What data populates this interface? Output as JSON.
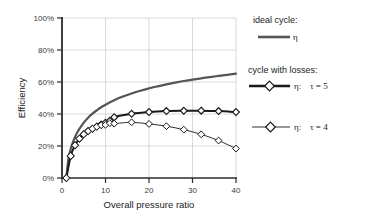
{
  "chart_data": {
    "type": "line",
    "title": "",
    "xlabel": "Overall pressure ratio",
    "ylabel": "Efficiency",
    "xlim": [
      0,
      40
    ],
    "ylim": [
      0,
      100
    ],
    "grid": true,
    "legend_position": "right",
    "xticks": [
      "0",
      "10",
      "20",
      "30",
      "40"
    ],
    "xtick_values": [
      0,
      10,
      20,
      30,
      40
    ],
    "yticks": [
      "0%",
      "20%",
      "40%",
      "60%",
      "80%",
      "100%"
    ],
    "ytick_values": [
      0,
      20,
      40,
      60,
      80,
      100
    ],
    "series": [
      {
        "name": "ideal cycle",
        "legend_symbol": "η",
        "style": "thick-line-no-marker",
        "color": "#555555",
        "x": [
          1,
          1.5,
          2,
          2.5,
          3,
          3.5,
          4,
          5,
          6,
          7,
          8,
          9,
          10,
          12,
          14,
          16,
          18,
          20,
          22,
          24,
          26,
          28,
          30,
          32,
          34,
          36,
          38,
          40
        ],
        "values": [
          0,
          12.5,
          18.1,
          22.2,
          25.6,
          28.4,
          30.7,
          34.6,
          37.7,
          40.2,
          42.3,
          44.2,
          45.8,
          48.6,
          50.9,
          52.8,
          54.5,
          56.0,
          57.3,
          58.5,
          59.6,
          60.6,
          61.5,
          62.3,
          63.1,
          63.8,
          64.5,
          65.2
        ]
      },
      {
        "name": "cycle with losses, tau = 5",
        "legend_symbol": "η",
        "legend_param": "τ = 5",
        "style": "thick-line-diamond-marker",
        "color": "#1a1a1a",
        "x": [
          1,
          2,
          3,
          4,
          5,
          6,
          7,
          8,
          9,
          10,
          11,
          12,
          16,
          20,
          24,
          28,
          32,
          36,
          40
        ],
        "values": [
          0,
          13.8,
          20.5,
          24.6,
          27.3,
          29.3,
          30.8,
          32.2,
          33.4,
          34.5,
          35.8,
          38.0,
          40.1,
          41.2,
          41.8,
          42.0,
          42.1,
          41.8,
          41.2
        ]
      },
      {
        "name": "cycle with losses, tau = 4",
        "legend_symbol": "η",
        "legend_param": "τ = 4",
        "style": "thin-line-diamond-marker",
        "color": "#1a1a1a",
        "x": [
          1,
          2,
          3,
          4,
          5,
          6,
          7,
          8,
          9,
          10,
          11,
          12,
          16,
          20,
          24,
          28,
          32,
          36,
          40
        ],
        "values": [
          0,
          13.8,
          20.5,
          24.6,
          27.3,
          29.3,
          30.8,
          32.0,
          33.0,
          33.2,
          34.3,
          34.0,
          34.8,
          33.8,
          32.4,
          30.2,
          27.3,
          23.4,
          18.4
        ]
      }
    ]
  },
  "legend": {
    "group1_title": "ideal cycle:",
    "group1_label": "η",
    "group2_title": "cycle with losses:",
    "group2_label": "η:",
    "group2_param": "τ = 5",
    "group3_label": "η:",
    "group3_param": "τ = 4"
  },
  "colors": {
    "ideal_line": "#555555",
    "loss_line": "#1a1a1a",
    "grid": "#cccccc",
    "axis": "#333333",
    "text": "#222222",
    "tick_text": "#3a3a3a",
    "background": "#ffffff"
  }
}
